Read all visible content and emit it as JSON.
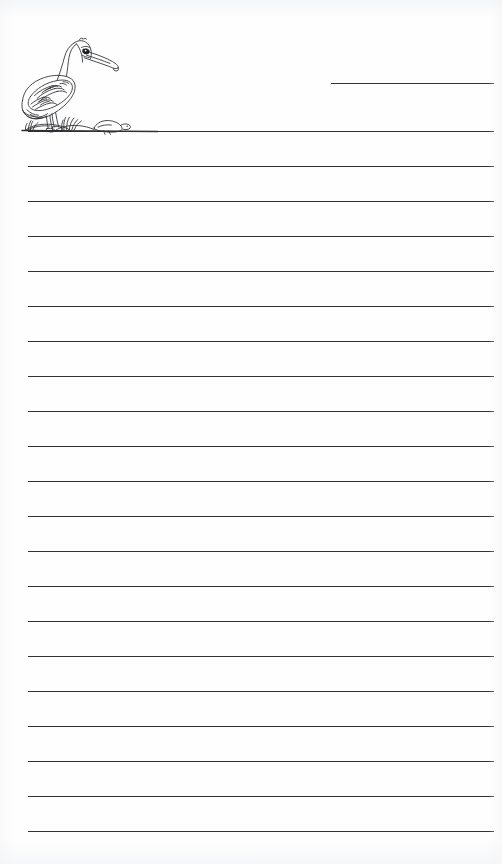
{
  "document": {
    "type": "lined-writing-paper",
    "title": "Pelican Lined Writing Paper",
    "page_width": 502,
    "page_height": 864,
    "background_color": "#fefefe",
    "ink_color": "#2f3033",
    "orientation": "portrait",
    "text_content": "",
    "is_blank": true
  },
  "illustration": {
    "name": "pelican-line-drawing",
    "subject": "pelican",
    "style": "black-and-white line art",
    "description": "A standing pelican in profile facing right, with a long hooked bill, hatched wing feathers, webbed feet on a sandy mound, tufts of grass, and a small chick or rock resting on the ground to its right.",
    "position": "top-left",
    "elements": [
      "pelican-body",
      "pelican-head",
      "pelican-bill",
      "pelican-eye",
      "pelican-wing-feathers",
      "pelican-tail",
      "pelican-legs",
      "pelican-feet",
      "grass-tuft-left",
      "grass-tuft-right",
      "ground-mound",
      "chick"
    ],
    "x": 8,
    "y": 30,
    "width": 150,
    "height": 108
  },
  "title_rule": {
    "name": "title-write-on-line",
    "label": "",
    "x": 331,
    "y": 83,
    "width": 163,
    "note": "short ruled line at top right for a name or title"
  },
  "ruled_lines": {
    "count": 21,
    "left": 28,
    "right": 494,
    "width": 466,
    "spacing": 35,
    "first_y": 131,
    "last_y": 831,
    "y_positions": [
      131,
      166,
      201,
      236,
      271,
      306,
      341,
      376,
      411,
      446,
      481,
      516,
      551,
      586,
      621,
      656,
      691,
      726,
      761,
      796,
      831
    ],
    "values": [
      "",
      "",
      "",
      "",
      "",
      "",
      "",
      "",
      "",
      "",
      "",
      "",
      "",
      "",
      "",
      "",
      "",
      "",
      "",
      "",
      ""
    ]
  }
}
